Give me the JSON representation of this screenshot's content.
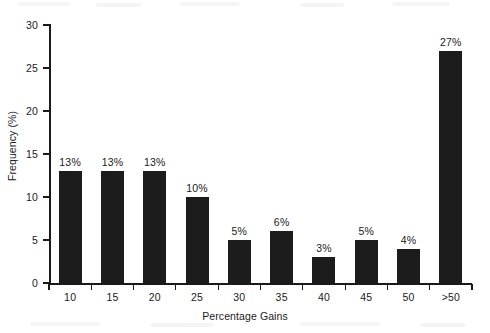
{
  "chart_data": {
    "type": "bar",
    "title": "",
    "subtitle": "",
    "xlabel": "Percentage Gains",
    "ylabel": "Frequency (%)",
    "categories": [
      "10",
      "15",
      "20",
      "25",
      "30",
      "35",
      "40",
      "45",
      "50",
      ">50"
    ],
    "values": [
      13,
      13,
      13,
      10,
      5,
      6,
      3,
      5,
      4,
      27
    ],
    "data_labels": [
      "13%",
      "13%",
      "13%",
      "10%",
      "5%",
      "6%",
      "3%",
      "5%",
      "4%",
      "27%"
    ],
    "ylim": [
      0,
      30
    ],
    "yticks": [
      0,
      5,
      10,
      15,
      20,
      25,
      30
    ],
    "ytick_labels": [
      "0",
      "5",
      "10",
      "15",
      "20",
      "25",
      "30"
    ],
    "grid": false,
    "legend": false,
    "legend_position": "none",
    "bar_color": "#1c1c1c",
    "axis_color": "#1a1a1a",
    "background_color": "#ffffff"
  }
}
